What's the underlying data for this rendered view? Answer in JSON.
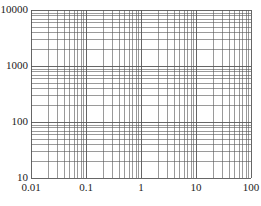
{
  "chart_data": {
    "type": "line",
    "title": "",
    "xlabel": "",
    "ylabel": "",
    "x_scale": "log",
    "y_scale": "log",
    "xlim": [
      0.01,
      100
    ],
    "ylim": [
      10,
      10000
    ],
    "x_tick_labels": [
      "0.01",
      "0.1",
      "1",
      "10",
      "100"
    ],
    "y_tick_labels": [
      "10",
      "100",
      "1000",
      "10000"
    ],
    "grid": true,
    "grid_minor": true,
    "series": [],
    "legend": null
  },
  "layout": {
    "plot_left": 31,
    "plot_right": 251,
    "plot_top": 10,
    "plot_bottom": 178,
    "grid_color": "#555555"
  }
}
